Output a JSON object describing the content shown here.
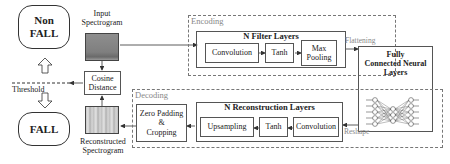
{
  "decision": {
    "non_fall": "Non FALL",
    "non_fall_line1": "Non",
    "non_fall_line2": "FALL",
    "fall": "FALL",
    "threshold": "Threshold"
  },
  "spectrograms": {
    "input_line1": "Input",
    "input_line2": "Spectrogram",
    "reconstructed_line1": "Reconstructed",
    "reconstructed_line2": "Spectrogram"
  },
  "cosine": {
    "line1": "Cosine",
    "line2": "Distance"
  },
  "encoding": {
    "title": "Encoding",
    "group_title": "N Filter Layers",
    "blocks": [
      "Convolution",
      "Tanh",
      "Max Pooling"
    ],
    "maxpool_line1": "Max",
    "maxpool_line2": "Pooling"
  },
  "flattening": "Flattening",
  "fc": {
    "line1": "Fully",
    "line2": "Connected Neural",
    "line3": "Layers"
  },
  "reshape": "Reshape",
  "decoding": {
    "title": "Decoding",
    "group_title": "N Reconstruction Layers",
    "blocks": [
      "Upsampling",
      "Tanh",
      "Convolution"
    ],
    "zero_pad_line1": "Zero Padding",
    "zero_pad_line2": "&",
    "zero_pad_line3": "Cropping"
  },
  "colors": {
    "border": "#555555",
    "dashed": "#777777",
    "input_spectrogram": "#8a8a8a",
    "reconstructed_spectrogram": "#b8b8b8",
    "annotation_text": "#888888"
  }
}
